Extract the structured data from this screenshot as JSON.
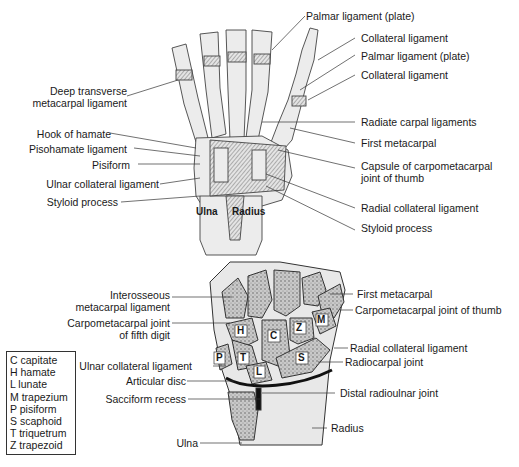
{
  "top_figure": {
    "title": "Ligaments of the hand and wrist (palmar view)",
    "bone_labels": {
      "ulna": "Ulna",
      "radius": "Radius"
    },
    "left_labels": [
      "Deep transverse\nmetacarpal ligament",
      "Hook of hamate",
      "Pisohamate ligament",
      "Pisiform",
      "Ulnar collateral ligament",
      "Styloid process"
    ],
    "right_labels": [
      "Palmar ligament (plate)",
      "Collateral ligament",
      "Palmar ligament (plate)",
      "Collateral ligament",
      "Radiate carpal ligaments",
      "First metacarpal",
      "Capsule of carpometacarpal\njoint of thumb",
      "Radial collateral ligament",
      "Styloid process"
    ]
  },
  "bottom_figure": {
    "title": "Coronal section of the wrist",
    "left_labels": [
      "Interosseous\nmetacarpal ligament",
      "Carpometacarpal joint\nof fifth digit",
      "Ulnar collateral ligament",
      "Articular disc",
      "Sacciform recess",
      "Ulna"
    ],
    "right_labels": [
      "First metacarpal",
      "Carpometacarpal joint of thumb",
      "Radial collateral ligament",
      "Radiocarpal joint",
      "Distal radioulnar joint",
      "Radius"
    ],
    "bone_letters": [
      "H",
      "C",
      "Z",
      "M",
      "P",
      "T",
      "L",
      "S"
    ]
  },
  "legend": {
    "items": [
      "C capitate",
      "H hamate",
      "L lunate",
      "M trapezium",
      "P pisiform",
      "S scaphoid",
      "T triquetrum",
      "Z trapezoid"
    ]
  }
}
